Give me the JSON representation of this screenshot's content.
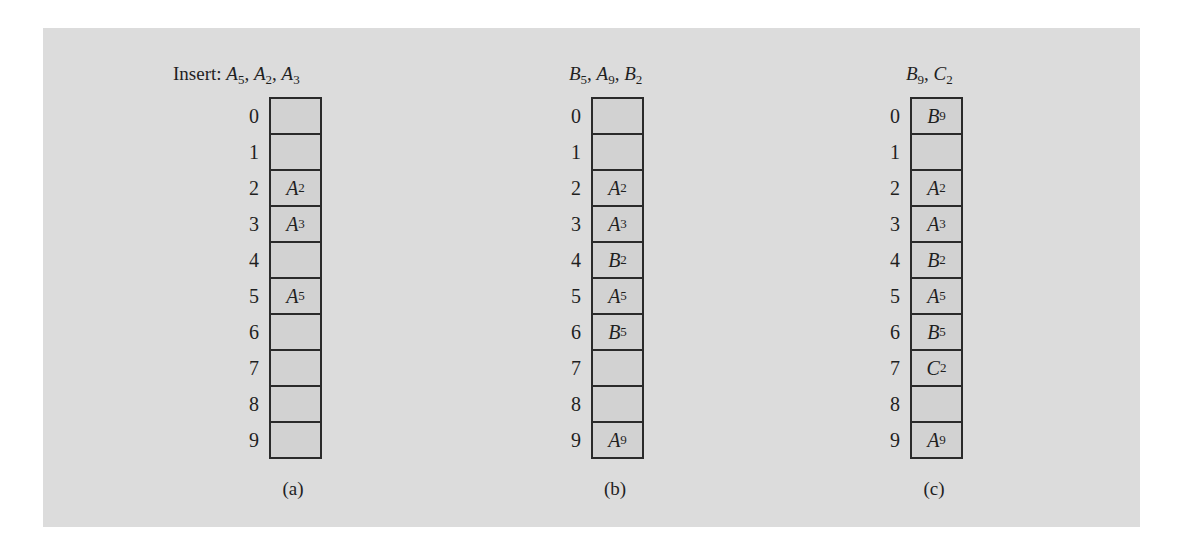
{
  "figure": {
    "panels": [
      {
        "id": "a",
        "header_prefix": "Insert: ",
        "inserted_keys": [
          {
            "letter": "A",
            "sub": "5"
          },
          {
            "letter": "A",
            "sub": "2"
          },
          {
            "letter": "A",
            "sub": "3"
          }
        ],
        "caption": "(a)",
        "slots": [
          {
            "index": "0",
            "letter": "",
            "sub": ""
          },
          {
            "index": "1",
            "letter": "",
            "sub": ""
          },
          {
            "index": "2",
            "letter": "A",
            "sub": "2"
          },
          {
            "index": "3",
            "letter": "A",
            "sub": "3"
          },
          {
            "index": "4",
            "letter": "",
            "sub": ""
          },
          {
            "index": "5",
            "letter": "A",
            "sub": "5"
          },
          {
            "index": "6",
            "letter": "",
            "sub": ""
          },
          {
            "index": "7",
            "letter": "",
            "sub": ""
          },
          {
            "index": "8",
            "letter": "",
            "sub": ""
          },
          {
            "index": "9",
            "letter": "",
            "sub": ""
          }
        ]
      },
      {
        "id": "b",
        "header_prefix": "",
        "inserted_keys": [
          {
            "letter": "B",
            "sub": "5"
          },
          {
            "letter": "A",
            "sub": "9"
          },
          {
            "letter": "B",
            "sub": "2"
          }
        ],
        "caption": "(b)",
        "slots": [
          {
            "index": "0",
            "letter": "",
            "sub": ""
          },
          {
            "index": "1",
            "letter": "",
            "sub": ""
          },
          {
            "index": "2",
            "letter": "A",
            "sub": "2"
          },
          {
            "index": "3",
            "letter": "A",
            "sub": "3"
          },
          {
            "index": "4",
            "letter": "B",
            "sub": "2"
          },
          {
            "index": "5",
            "letter": "A",
            "sub": "5"
          },
          {
            "index": "6",
            "letter": "B",
            "sub": "5"
          },
          {
            "index": "7",
            "letter": "",
            "sub": ""
          },
          {
            "index": "8",
            "letter": "",
            "sub": ""
          },
          {
            "index": "9",
            "letter": "A",
            "sub": "9"
          }
        ]
      },
      {
        "id": "c",
        "header_prefix": "",
        "inserted_keys": [
          {
            "letter": "B",
            "sub": "9"
          },
          {
            "letter": "C",
            "sub": "2"
          }
        ],
        "caption": "(c)",
        "slots": [
          {
            "index": "0",
            "letter": "B",
            "sub": "9"
          },
          {
            "index": "1",
            "letter": "",
            "sub": ""
          },
          {
            "index": "2",
            "letter": "A",
            "sub": "2"
          },
          {
            "index": "3",
            "letter": "A",
            "sub": "3"
          },
          {
            "index": "4",
            "letter": "B",
            "sub": "2"
          },
          {
            "index": "5",
            "letter": "A",
            "sub": "5"
          },
          {
            "index": "6",
            "letter": "B",
            "sub": "5"
          },
          {
            "index": "7",
            "letter": "C",
            "sub": "2"
          },
          {
            "index": "8",
            "letter": "",
            "sub": ""
          },
          {
            "index": "9",
            "letter": "A",
            "sub": "9"
          }
        ]
      }
    ],
    "layout": {
      "panel_bg": "#dcdcdc",
      "cell_bg": "#d2d2d2",
      "border_color": "#2a2a2a",
      "text_color": "#1f1f1f"
    }
  }
}
